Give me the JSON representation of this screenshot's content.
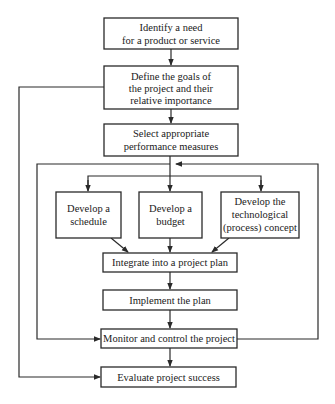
{
  "diagram": {
    "type": "flowchart",
    "colors": {
      "line": "#2a2a2a",
      "box_fill": "#ffffff",
      "text": "#1a1a1a",
      "background": "#ffffff"
    },
    "nodes": {
      "identify_need": {
        "lines": [
          "Identify a need",
          "for a product or service"
        ]
      },
      "define_goals": {
        "lines": [
          "Define the goals of",
          "the project and their",
          "relative importance"
        ]
      },
      "select_measures": {
        "lines": [
          "Select appropriate",
          "performance measures"
        ]
      },
      "develop_schedule": {
        "lines": [
          "Develop a",
          "schedule"
        ]
      },
      "develop_budget": {
        "lines": [
          "Develop a",
          "budget"
        ]
      },
      "develop_tech": {
        "lines": [
          "Develop the",
          "technological",
          "(process) concept"
        ]
      },
      "integrate": {
        "lines": [
          "Integrate into a project plan"
        ]
      },
      "implement": {
        "lines": [
          "Implement the plan"
        ]
      },
      "monitor": {
        "lines": [
          "Monitor and control the project"
        ]
      },
      "evaluate": {
        "lines": [
          "Evaluate project success"
        ]
      }
    },
    "edges": [
      {
        "from": "identify_need",
        "to": "define_goals"
      },
      {
        "from": "define_goals",
        "to": "select_measures"
      },
      {
        "from": "select_measures",
        "to": "develop_schedule"
      },
      {
        "from": "select_measures",
        "to": "develop_budget"
      },
      {
        "from": "select_measures",
        "to": "develop_tech"
      },
      {
        "from": "develop_schedule",
        "to": "integrate"
      },
      {
        "from": "develop_budget",
        "to": "integrate"
      },
      {
        "from": "develop_tech",
        "to": "integrate"
      },
      {
        "from": "integrate",
        "to": "implement"
      },
      {
        "from": "implement",
        "to": "monitor"
      },
      {
        "from": "monitor",
        "to": "evaluate"
      },
      {
        "from": "monitor",
        "to": "develop_schedule",
        "kind": "feedback-loop"
      },
      {
        "from": "define_goals",
        "to": "evaluate",
        "kind": "feedback-loop"
      },
      {
        "from": "select_measures",
        "to": "monitor",
        "kind": "feedback-loop"
      }
    ]
  }
}
